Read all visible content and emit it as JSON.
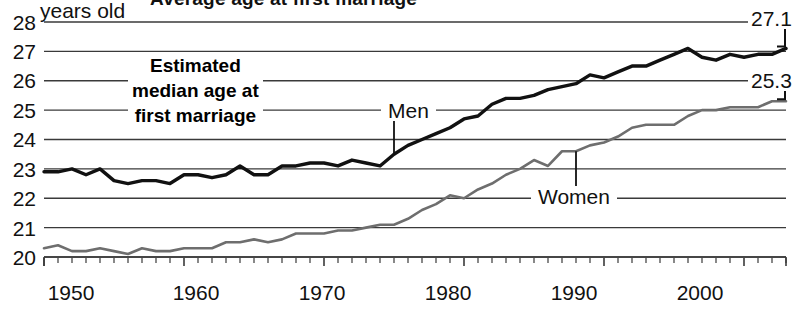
{
  "title": "Average age at first marriage",
  "annotation": {
    "line1": "Estimated",
    "line2": "median age at",
    "line3": "first marriage"
  },
  "axes": {
    "y_unit_label": "years old",
    "y_ticks": [
      "28",
      "27",
      "26",
      "25",
      "24",
      "23",
      "22",
      "21",
      "20"
    ],
    "x_ticks": [
      "1950",
      "1960",
      "1970",
      "1980",
      "1990",
      "2000"
    ]
  },
  "series_labels": {
    "men": "Men",
    "women": "Women"
  },
  "end_values": {
    "men": "27.1",
    "women": "25.3"
  },
  "colors": {
    "men_line": "#111111",
    "women_line": "#6e6e6e",
    "gridline": "#3a3a3a",
    "background": "#ffffff",
    "text": "#111111"
  },
  "chart_data": {
    "type": "line",
    "title": "Average age at first marriage",
    "xlabel": "",
    "ylabel": "years old",
    "xlim": [
      1950,
      2003
    ],
    "ylim": [
      20,
      28
    ],
    "grid": true,
    "legend": "inline-labels",
    "yticks": [
      20,
      21,
      22,
      23,
      24,
      25,
      26,
      27,
      28
    ],
    "xticks": [
      1950,
      1960,
      1970,
      1980,
      1990,
      2000
    ],
    "x": [
      1950,
      1951,
      1952,
      1953,
      1954,
      1955,
      1956,
      1957,
      1958,
      1959,
      1960,
      1961,
      1962,
      1963,
      1964,
      1965,
      1966,
      1967,
      1968,
      1969,
      1970,
      1971,
      1972,
      1973,
      1974,
      1975,
      1976,
      1977,
      1978,
      1979,
      1980,
      1981,
      1982,
      1983,
      1984,
      1985,
      1986,
      1987,
      1988,
      1989,
      1990,
      1991,
      1992,
      1993,
      1994,
      1995,
      1996,
      1997,
      1998,
      1999,
      2000,
      2001,
      2002,
      2003
    ],
    "series": [
      {
        "name": "Men",
        "color": "#111111",
        "end_value": 27.1,
        "values": [
          22.9,
          22.9,
          23.0,
          22.8,
          23.0,
          22.6,
          22.5,
          22.6,
          22.6,
          22.5,
          22.8,
          22.8,
          22.7,
          22.8,
          23.1,
          22.8,
          22.8,
          23.1,
          23.1,
          23.2,
          23.2,
          23.1,
          23.3,
          23.2,
          23.1,
          23.5,
          23.8,
          24.0,
          24.2,
          24.4,
          24.7,
          24.8,
          25.2,
          25.4,
          25.4,
          25.5,
          25.7,
          25.8,
          25.9,
          26.2,
          26.1,
          26.3,
          26.5,
          26.5,
          26.7,
          26.9,
          27.1,
          26.8,
          26.7,
          26.9,
          26.8,
          26.9,
          26.9,
          27.1
        ]
      },
      {
        "name": "Women",
        "color": "#6e6e6e",
        "end_value": 25.3,
        "values": [
          20.3,
          20.4,
          20.2,
          20.2,
          20.3,
          20.2,
          20.1,
          20.3,
          20.2,
          20.2,
          20.3,
          20.3,
          20.3,
          20.5,
          20.5,
          20.6,
          20.5,
          20.6,
          20.8,
          20.8,
          20.8,
          20.9,
          20.9,
          21.0,
          21.1,
          21.1,
          21.3,
          21.6,
          21.8,
          22.1,
          22.0,
          22.3,
          22.5,
          22.8,
          23.0,
          23.3,
          23.1,
          23.6,
          23.6,
          23.8,
          23.9,
          24.1,
          24.4,
          24.5,
          24.5,
          24.5,
          24.8,
          25.0,
          25.0,
          25.1,
          25.1,
          25.1,
          25.3,
          25.3
        ]
      }
    ]
  }
}
